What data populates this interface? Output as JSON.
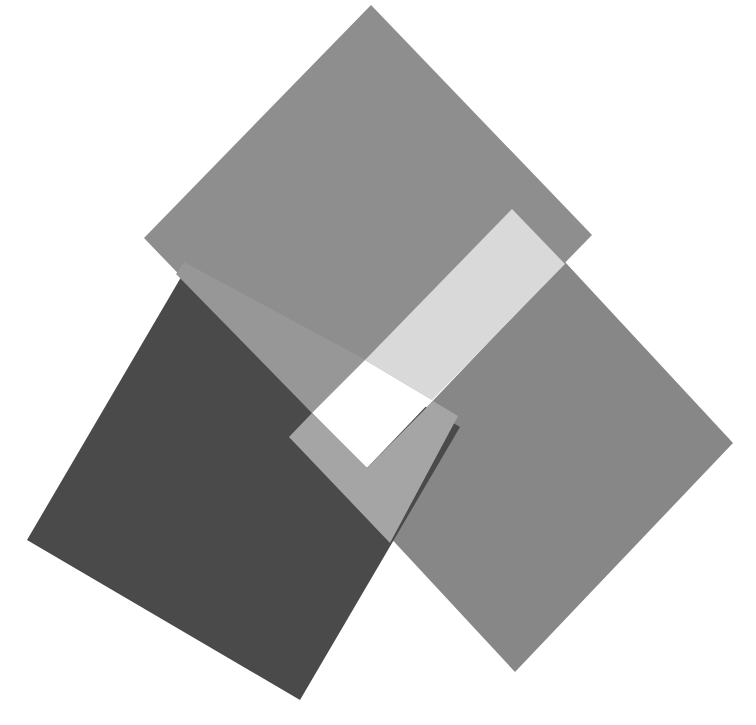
{
  "canvas": {
    "width": 756,
    "height": 725,
    "background": "#ffffff"
  },
  "shapes": [
    {
      "name": "right-square",
      "color": "#878787",
      "points": "565,262 733,443 515,672 347,491"
    },
    {
      "name": "dark-square",
      "color": "#4a4a4a",
      "points": "187,267 460,427 300,700 27,540"
    },
    {
      "name": "top-square",
      "color": "#8e8e8e",
      "points": "371,5 592,235 365,468 144,238"
    },
    {
      "name": "top-dark-overlap-band",
      "color": "#979797",
      "points": "184,262 366,360 312,413 176,274"
    },
    {
      "name": "light-band",
      "color": "#d9d9d9",
      "points": "512,209 565,264 432,400 365,360"
    },
    {
      "name": "white-patch",
      "color": "#ffffff",
      "points": "365,360 432,400 367,468 312,413"
    },
    {
      "name": "lower-gray-band",
      "color": "#a5a5a5",
      "points": "289,437 312,413 367,468 433,401 458,416 390,543"
    }
  ]
}
